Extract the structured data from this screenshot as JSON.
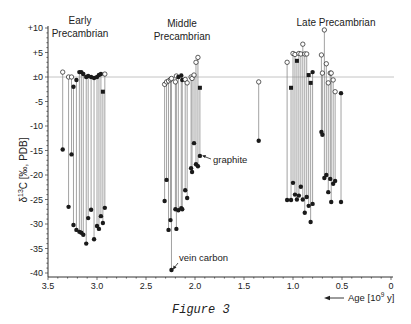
{
  "figure": {
    "caption": "Figure 3",
    "colors": {
      "axis": "#333333",
      "stem": "#8a8a8a",
      "zero_line": "#bdbdbd",
      "marker": "#1a1a1a",
      "text": "#222222"
    }
  },
  "chart_data": {
    "type": "scatter",
    "subtype": "stem-pairs (top = carbonate δ13C, bottom = organic carbon δ13C)",
    "title": "",
    "xlabel": "Age [10^9 y]",
    "ylabel": "δ13C [‰, PDB]",
    "xlim": [
      3.5,
      0
    ],
    "ylim": [
      -40,
      10
    ],
    "x_reversed": true,
    "x_ticks": [
      3.5,
      3.0,
      2.5,
      2.0,
      1.5,
      1.0,
      0.5,
      0
    ],
    "x_tick_labels": [
      "3.5",
      "3.0",
      "2.5",
      "2.0",
      "1.5",
      "1.0",
      "0.5",
      "0"
    ],
    "y_ticks": [
      10,
      5,
      0,
      -5,
      -10,
      -15,
      -20,
      -25,
      -30,
      -35,
      -40
    ],
    "y_tick_labels": [
      "+10",
      "+5",
      "±0",
      "-5",
      "-10",
      "-15",
      "-20",
      "-25",
      "-30",
      "-35",
      "-40"
    ],
    "zero_line": true,
    "grid": false,
    "legend": null,
    "group_labels": [
      {
        "line1": "Early",
        "line2": "Precambrian",
        "x": 80,
        "y1": 24,
        "y2": 37
      },
      {
        "line1": "Middle",
        "line2": "Precambrian",
        "x": 182,
        "y1": 27,
        "y2": 39
      },
      {
        "line1": "Late Precambrian",
        "line2": "",
        "x": 336,
        "y1": 25,
        "y2": 0
      }
    ],
    "annotations": [
      {
        "text": "graphite",
        "x": 213,
        "y": 163,
        "arrow_from": [
          211,
          159
        ],
        "arrow_to": [
          202,
          156
        ]
      },
      {
        "text": "vein carbon",
        "x": 179,
        "y": 260,
        "arrow_from": [
          178,
          263
        ],
        "arrow_to": [
          173,
          269
        ]
      }
    ],
    "series": [
      {
        "name": "Early Precambrian",
        "points": [
          {
            "age": 3.35,
            "top": 1.0,
            "top_marker": "open",
            "bottom": -14.8
          },
          {
            "age": 3.29,
            "top": 0.0,
            "top_marker": "open",
            "bottom": -26.5
          },
          {
            "age": 3.26,
            "top": 0.0,
            "top_marker": "open",
            "bottom": -15.8
          },
          {
            "age": 3.24,
            "top": -2.0,
            "top_marker": "filled",
            "bottom": -30.2
          },
          {
            "age": 3.21,
            "top": -0.6,
            "top_marker": "filled",
            "bottom": -31.2
          },
          {
            "age": 3.18,
            "top": 1.0,
            "top_marker": "filled",
            "bottom": -31.6
          },
          {
            "age": 3.16,
            "top": 1.0,
            "top_marker": "filled",
            "bottom": -31.8
          },
          {
            "age": 3.14,
            "top": 0.6,
            "top_marker": "filled",
            "bottom": -32.2
          },
          {
            "age": 3.11,
            "top": 0.0,
            "top_marker": "filled",
            "bottom": -34.0
          },
          {
            "age": 3.09,
            "top": 0.2,
            "top_marker": "filled",
            "bottom": -28.8
          },
          {
            "age": 3.06,
            "top": 0.0,
            "top_marker": "filled",
            "bottom": -27.1
          },
          {
            "age": 3.03,
            "top": -0.2,
            "top_marker": "filled",
            "bottom": -33.1
          },
          {
            "age": 3.0,
            "top": 0.0,
            "top_marker": "filled",
            "bottom": -30.4
          },
          {
            "age": 2.98,
            "top": 0.4,
            "top_marker": "filled",
            "bottom": -31.0
          },
          {
            "age": 2.96,
            "top": 0.6,
            "top_marker": "filled",
            "bottom": -28.4
          },
          {
            "age": 2.94,
            "top": -3.0,
            "top_marker": "square",
            "bottom": -29.8
          },
          {
            "age": 2.92,
            "top": 0.6,
            "top_marker": "open",
            "bottom": -26.7
          }
        ]
      },
      {
        "name": "Middle Precambrian",
        "points": [
          {
            "age": 2.31,
            "top": -1.5,
            "top_marker": "open",
            "bottom": -25.3
          },
          {
            "age": 2.29,
            "top": -1.0,
            "top_marker": "open",
            "bottom": -21.0
          },
          {
            "age": 2.27,
            "top": -0.8,
            "top_marker": "open",
            "bottom": -31.2
          },
          {
            "age": 2.25,
            "top": -0.5,
            "top_marker": "open",
            "bottom": -29.2
          },
          {
            "age": 2.24,
            "top": -0.3,
            "top_marker": "open",
            "bottom": -39.4,
            "note": "vein carbon"
          },
          {
            "age": 2.2,
            "top": -1.0,
            "top_marker": "open",
            "bottom": -27.0
          },
          {
            "age": 2.19,
            "top": 0.2,
            "top_marker": "open",
            "bottom": -31.0
          },
          {
            "age": 2.17,
            "top": 0.0,
            "top_marker": "filled",
            "bottom": -27.2
          },
          {
            "age": 2.14,
            "top": 0.3,
            "top_marker": "filled",
            "bottom": -26.8
          },
          {
            "age": 2.13,
            "top": -0.6,
            "top_marker": "filled",
            "bottom": -27.0
          },
          {
            "age": 2.1,
            "top": -0.5,
            "top_marker": "open",
            "bottom": -23.1
          },
          {
            "age": 2.08,
            "top": -1.2,
            "top_marker": "open",
            "bottom": -24.7
          },
          {
            "age": 2.04,
            "top": 0.0,
            "top_marker": "open",
            "bottom": -18.6
          },
          {
            "age": 2.03,
            "top": -0.3,
            "top_marker": "open",
            "bottom": -19.4
          },
          {
            "age": 2.01,
            "top": 0.4,
            "top_marker": "open",
            "bottom": -13.5
          },
          {
            "age": 1.99,
            "top": 3.0,
            "top_marker": "open",
            "bottom": -17.8
          },
          {
            "age": 1.97,
            "top": 4.0,
            "top_marker": "open",
            "bottom": -18.2,
            "note": "graphite"
          },
          {
            "age": 1.95,
            "top": -2.2,
            "top_marker": "square",
            "bottom": -16.1
          }
        ]
      },
      {
        "name": "Mid-Proterozoic single",
        "points": [
          {
            "age": 1.35,
            "top": -1.0,
            "top_marker": "open",
            "bottom": -13.0
          }
        ]
      },
      {
        "name": "Late Precambrian",
        "points": [
          {
            "age": 1.06,
            "top": 3.0,
            "top_marker": "open",
            "bottom": -25.1
          },
          {
            "age": 1.02,
            "top": -2.2,
            "top_marker": "square",
            "bottom": -25.1
          },
          {
            "age": 1.0,
            "top": 4.8,
            "top_marker": "open",
            "bottom": -21.6
          },
          {
            "age": 0.98,
            "top": 4.6,
            "top_marker": "open",
            "bottom": -24.0
          },
          {
            "age": 0.96,
            "top": 3.3,
            "top_marker": "square",
            "bottom": -25.0
          },
          {
            "age": 0.94,
            "top": 4.8,
            "top_marker": "open",
            "bottom": -24.2
          },
          {
            "age": 0.92,
            "top": 4.7,
            "top_marker": "open",
            "bottom": -22.4
          },
          {
            "age": 0.9,
            "top": 6.7,
            "top_marker": "open",
            "bottom": -25.0
          },
          {
            "age": 0.88,
            "top": 4.7,
            "top_marker": "open",
            "bottom": -27.7
          },
          {
            "age": 0.86,
            "top": 4.7,
            "top_marker": "open",
            "bottom": -24.5
          },
          {
            "age": 0.84,
            "top": 0.4,
            "top_marker": "square",
            "bottom": -26.3
          },
          {
            "age": 0.82,
            "top": -1.2,
            "top_marker": "square",
            "bottom": -29.6
          },
          {
            "age": 0.8,
            "top": 1.0,
            "top_marker": "filled",
            "bottom": -25.9
          },
          {
            "age": 0.71,
            "top": 4.5,
            "top_marker": "open",
            "bottom": -11.2
          },
          {
            "age": 0.7,
            "top": 0.8,
            "top_marker": "open",
            "bottom": -11.8
          },
          {
            "age": 0.68,
            "top": 9.6,
            "top_marker": "open",
            "bottom": -20.6
          },
          {
            "age": 0.66,
            "top": 2.7,
            "top_marker": "open",
            "bottom": -20.0
          },
          {
            "age": 0.64,
            "top": -1.2,
            "top_marker": "open",
            "bottom": -23.5
          },
          {
            "age": 0.62,
            "top": 0.8,
            "top_marker": "open",
            "bottom": -20.8
          },
          {
            "age": 0.61,
            "top": 0.8,
            "top_marker": "open",
            "bottom": -25.5
          },
          {
            "age": 0.59,
            "top": -0.6,
            "top_marker": "open",
            "bottom": -21.8
          },
          {
            "age": 0.57,
            "top": -3.0,
            "top_marker": "open",
            "bottom": -21.2
          },
          {
            "age": 0.51,
            "top": -3.3,
            "top_marker": "filled",
            "bottom": -25.5
          }
        ]
      }
    ]
  },
  "labels": {
    "group_early_1": "Early",
    "group_early_2": "Precambrian",
    "group_middle_1": "Middle",
    "group_middle_2": "Precambrian",
    "group_late": "Late Precambrian",
    "graphite": "graphite",
    "vein_carbon": "vein carbon",
    "ylabel_delta": "δ",
    "ylabel_sup": "13",
    "ylabel_rest": "C [‰, PDB]",
    "xlabel_main": "Age [10",
    "xlabel_sup": "9",
    "xlabel_rest": " y]"
  }
}
